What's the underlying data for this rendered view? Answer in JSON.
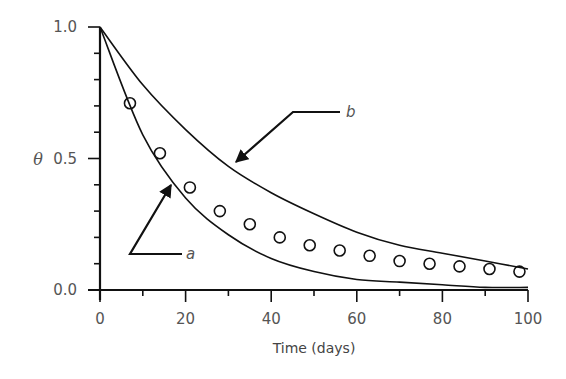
{
  "chart_data": {
    "type": "line",
    "title": "",
    "xlabel": "Time (days)",
    "ylabel": "θ",
    "xlim": [
      0,
      100
    ],
    "ylim": [
      0.0,
      1.0
    ],
    "x_ticks": [
      0,
      20,
      40,
      60,
      80,
      100
    ],
    "x_tick_labels": [
      "0",
      "20",
      "40",
      "60",
      "80",
      "100"
    ],
    "x_minor_step": 10,
    "y_ticks": [
      0.0,
      0.5,
      1.0
    ],
    "y_tick_labels": [
      "0.0",
      "0.5",
      "1.0"
    ],
    "y_minor_step": 0.1,
    "grid": false,
    "legend": "none (curves annotated with arrows a and b)",
    "series": [
      {
        "name": "a",
        "style": "line",
        "description": "faster decay curve, approaches 0 by ~100 days",
        "x": [
          0,
          10,
          20,
          30,
          40,
          50,
          60,
          70,
          80,
          90,
          100
        ],
        "values": [
          1.0,
          0.59,
          0.35,
          0.21,
          0.12,
          0.07,
          0.04,
          0.03,
          0.02,
          0.01,
          0.01
        ]
      },
      {
        "name": "b",
        "style": "line",
        "description": "slower decay curve",
        "x": [
          0,
          10,
          20,
          30,
          40,
          50,
          60,
          70,
          80,
          90,
          100
        ],
        "values": [
          1.0,
          0.78,
          0.61,
          0.47,
          0.37,
          0.29,
          0.22,
          0.17,
          0.14,
          0.11,
          0.08
        ]
      },
      {
        "name": "observed",
        "style": "open-circle markers",
        "x": [
          7,
          14,
          21,
          28,
          35,
          42,
          49,
          56,
          63,
          70,
          77,
          84,
          91,
          98
        ],
        "values": [
          0.71,
          0.52,
          0.39,
          0.3,
          0.25,
          0.2,
          0.17,
          0.15,
          0.13,
          0.11,
          0.1,
          0.09,
          0.08,
          0.07
        ]
      }
    ],
    "annotations": [
      {
        "label": "a",
        "points_to": "curve a near x≈17, θ≈0.41"
      },
      {
        "label": "b",
        "points_to": "curve b near x≈31, θ≈0.47"
      }
    ]
  },
  "labels": {
    "xlabel": "Time (days)",
    "ylabel": "θ",
    "y_tick_0": "0.0",
    "y_tick_1": "0.5",
    "y_tick_2": "1.0",
    "x_tick_0": "0",
    "x_tick_1": "20",
    "x_tick_2": "40",
    "x_tick_3": "60",
    "x_tick_4": "80",
    "x_tick_5": "100",
    "annotation_a": "a",
    "annotation_b": "b"
  },
  "colors": {
    "line": "#111111",
    "text": "#555555",
    "background": "#ffffff"
  }
}
